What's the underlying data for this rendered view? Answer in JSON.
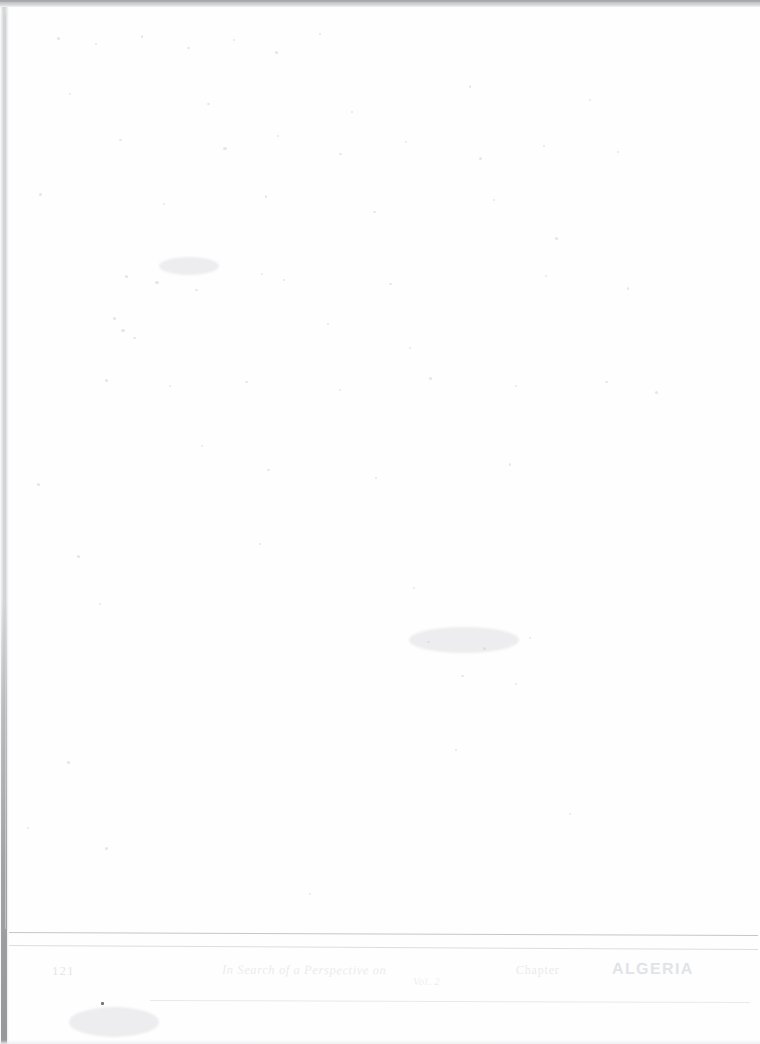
{
  "page": {
    "width": 760,
    "height": 1044,
    "background_color": "#ffffff",
    "document_type": "scanned-blank-page",
    "body_text": ""
  },
  "scan_artifacts": {
    "top_edge_color": "#c2c4c6",
    "left_edge_color": "#cfd1d3",
    "hairline_color": "#cdcfd1",
    "rule_color": "#c4c6c9"
  },
  "footer": {
    "page_number": "121",
    "title": "In Search of a Perspective on",
    "note": "Vol. 2",
    "section": "Chapter",
    "heading": "ALGERIA"
  },
  "marks": {
    "ink_speck_color": "#5a5c60",
    "dust_color": "#aaacb0"
  }
}
